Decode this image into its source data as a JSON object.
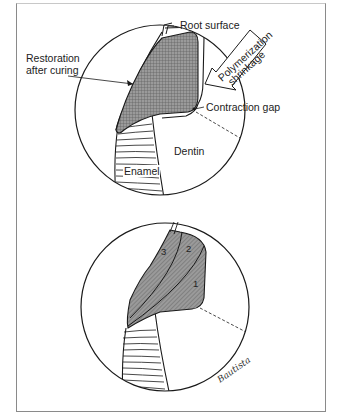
{
  "figure": {
    "top_panel": {
      "labels": {
        "root_surface": "Root surface",
        "polymerization_line1": "Polymerization",
        "polymerization_line2": "shrinkage",
        "restoration_line1": "Restoration",
        "restoration_line2": "after curing",
        "contraction_gap": "Contraction gap",
        "dentin": "Dentin",
        "enamel": "Enamel"
      }
    },
    "bottom_panel": {
      "increments": [
        "1",
        "2",
        "3"
      ]
    },
    "signature": "Bautista"
  },
  "colors": {
    "line": "#1a1a1a",
    "restoration_fill": "#8c8c8c",
    "frame": "#8a8a8a",
    "background": "#ffffff"
  }
}
